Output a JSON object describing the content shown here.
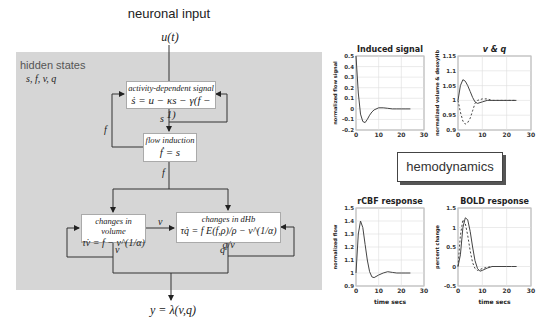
{
  "diagram": {
    "title": "neuronal input",
    "input_label": "u(t)",
    "panel": {
      "label": "hidden states",
      "states": "s, f, v, q",
      "color": "#d6d6d6"
    },
    "nodes": {
      "activity": {
        "caption": "activity-dependent signal",
        "equation": "ṡ = u − κs − γ(f − 1)"
      },
      "flow": {
        "caption": "flow induction",
        "equation": "ḟ = s"
      },
      "volume": {
        "caption": "changes in volume",
        "equation": "τv̇ = f − v^(1/α)"
      },
      "dhb": {
        "caption": "changes in dHb",
        "equation": "τq̇ = f E(f,ρ)/ρ − v^(1/α) q/v"
      }
    },
    "edge_labels": {
      "s": "s",
      "f_feedback": "f",
      "f_out": "f",
      "v_to_q": "v",
      "v_out": "v",
      "q_out": "q"
    },
    "output_label": "y = λ(v,q)",
    "hemodynamics_label": "hemodynamics"
  },
  "chart_data": [
    {
      "type": "line",
      "title": "Induced signal",
      "xlabel": "",
      "ylabel": "normalized flow signal",
      "xlim": [
        0,
        30
      ],
      "ylim": [
        -0.2,
        0.5
      ],
      "xticks": [
        "0",
        "10",
        "20",
        "30"
      ],
      "yticks": [
        "-0.2",
        "-0.1",
        "0",
        "0.1",
        "0.2",
        "0.3",
        "0.4",
        "0.5"
      ],
      "grid": true,
      "series": [
        {
          "name": "s",
          "style": "solid",
          "x": [
            0,
            1,
            2,
            3,
            4,
            5,
            6,
            7,
            8,
            10,
            12,
            14,
            16,
            18,
            20,
            22,
            24
          ],
          "y": [
            0.5,
            0.15,
            -0.05,
            -0.12,
            -0.13,
            -0.1,
            -0.06,
            -0.03,
            -0.01,
            0.01,
            0.01,
            0.005,
            0,
            0,
            0,
            0,
            0
          ]
        }
      ]
    },
    {
      "type": "line",
      "title": "v & q",
      "xlabel": "",
      "ylabel": "normalized volume & deoxyHb",
      "xlim": [
        0,
        30
      ],
      "ylim": [
        0.9,
        1.15
      ],
      "xticks": [
        "0",
        "10",
        "20",
        "30"
      ],
      "yticks": [
        "0.9",
        "0.95",
        "1",
        "1.05",
        "1.1",
        "1.15"
      ],
      "grid": true,
      "series": [
        {
          "name": "v",
          "style": "solid",
          "x": [
            0,
            1,
            2,
            3,
            4,
            5,
            6,
            7,
            8,
            10,
            12,
            14,
            16,
            18,
            20,
            22,
            24
          ],
          "y": [
            1.0,
            1.05,
            1.07,
            1.065,
            1.05,
            1.03,
            1.01,
            0.995,
            0.99,
            0.995,
            1.0,
            1.0,
            1.0,
            1.0,
            1.0,
            1.0,
            1.0
          ]
        },
        {
          "name": "q",
          "style": "dashed",
          "x": [
            0,
            1,
            2,
            3,
            4,
            5,
            6,
            7,
            8,
            10,
            12,
            14,
            16,
            18,
            20,
            22,
            24
          ],
          "y": [
            1.0,
            0.96,
            0.93,
            0.92,
            0.925,
            0.94,
            0.965,
            0.99,
            1.0,
            1.005,
            1.005,
            1.0,
            1.0,
            1.0,
            1.0,
            1.0,
            1.0
          ]
        }
      ]
    },
    {
      "type": "line",
      "title": "rCBF response",
      "xlabel": "time secs",
      "ylabel": "normalized flow",
      "xlim": [
        0,
        30
      ],
      "ylim": [
        0.9,
        1.5
      ],
      "xticks": [
        "0",
        "10",
        "20",
        "30"
      ],
      "yticks": [
        "0.9",
        "1",
        "1.1",
        "1.2",
        "1.3",
        "1.4",
        "1.5"
      ],
      "grid": true,
      "series": [
        {
          "name": "f",
          "style": "solid",
          "x": [
            0,
            1,
            2,
            3,
            4,
            5,
            6,
            7,
            8,
            10,
            12,
            14,
            16,
            18,
            20,
            22,
            24
          ],
          "y": [
            1.0,
            1.3,
            1.4,
            1.35,
            1.22,
            1.1,
            1.01,
            0.97,
            0.965,
            0.985,
            1.0,
            1.01,
            1.005,
            1.0,
            1.0,
            1.0,
            1.0
          ]
        }
      ]
    },
    {
      "type": "line",
      "title": "BOLD response",
      "xlabel": "time secs",
      "ylabel": "percent change",
      "xlim": [
        0,
        30
      ],
      "ylim": [
        -0.5,
        1.5
      ],
      "xticks": [
        "0",
        "10",
        "20",
        "30"
      ],
      "yticks": [
        "-0.5",
        "0",
        "0.5",
        "1",
        "1.5"
      ],
      "grid": true,
      "series": [
        {
          "name": "BOLD",
          "style": "solid",
          "x": [
            0,
            1,
            2,
            3,
            4,
            5,
            6,
            7,
            8,
            9,
            10,
            12,
            14,
            16,
            18,
            20,
            22,
            24
          ],
          "y": [
            0,
            0.3,
            1.0,
            1.25,
            1.2,
            0.9,
            0.5,
            0.15,
            -0.05,
            -0.12,
            -0.1,
            -0.04,
            0,
            0,
            0,
            0,
            0,
            0
          ]
        },
        {
          "name": "BOLD (dashed)",
          "style": "dashed",
          "x": [
            0,
            1,
            2,
            3,
            4,
            5,
            6,
            7,
            8,
            9,
            10,
            12,
            14,
            16,
            18,
            20,
            22,
            24
          ],
          "y": [
            0,
            0.8,
            1.2,
            1.1,
            0.8,
            0.4,
            0.1,
            -0.05,
            -0.1,
            -0.08,
            -0.05,
            -0.02,
            0,
            0,
            0,
            0,
            0,
            0
          ]
        }
      ]
    }
  ]
}
